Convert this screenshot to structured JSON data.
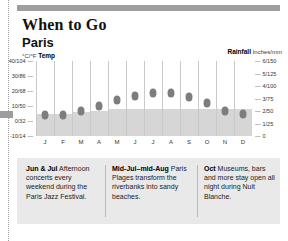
{
  "header": {
    "title": "When to Go",
    "subtitle": "Paris"
  },
  "legend": {
    "left_units": "°C/°F",
    "left_label": "Temp",
    "right_label": "Rainfall",
    "right_units": "Inches/mm"
  },
  "chart_data": {
    "type": "bar",
    "subtitle": "Paris",
    "categories": [
      "J",
      "F",
      "M",
      "A",
      "M",
      "J",
      "J",
      "A",
      "S",
      "O",
      "N",
      "D"
    ],
    "months_full": [
      "January",
      "February",
      "March",
      "April",
      "May",
      "June",
      "July",
      "August",
      "September",
      "October",
      "November",
      "December"
    ],
    "grid": false,
    "legend_position": "top",
    "series": [
      {
        "name": "Rainfall",
        "type": "bar",
        "unit": "Inches/mm",
        "values": [
          1.8,
          1.8,
          1.9,
          2.0,
          2.2,
          2.2,
          2.2,
          2.2,
          2.2,
          2.2,
          2.2,
          2.2
        ],
        "axis": "right",
        "color": "#d6d6d6"
      },
      {
        "name": "Temp",
        "type": "scatter",
        "unit": "°C/°F",
        "values": [
          4,
          4,
          7,
          10,
          14,
          17,
          19,
          19,
          16,
          12,
          7,
          5
        ],
        "axis": "left",
        "color": "#7d7d7d"
      }
    ],
    "left_axis": {
      "label": "°C/°F Temp",
      "ylim": [
        -10,
        40
      ],
      "ticks": [
        40,
        30,
        20,
        10,
        0,
        -10
      ],
      "tick_labels": [
        "40/104",
        "30/86",
        "20/68",
        "10/50",
        "0/32",
        "-10/14"
      ]
    },
    "right_axis": {
      "label": "Rainfall Inches/mm",
      "ylim": [
        0,
        6
      ],
      "ticks": [
        6,
        5,
        4,
        3,
        2,
        1,
        0
      ],
      "tick_labels": [
        "6/150",
        "5/125",
        "4/100",
        "3/75",
        "2/50",
        "1/25",
        "0"
      ]
    }
  },
  "notes": [
    {
      "id": "note-jun-jul",
      "bold": "Jun & Jul",
      "text": " Afternoon concerts every weekend during the Paris Jazz Festival."
    },
    {
      "id": "note-mid-jul-mid-aug",
      "bold": "Mid-Jul–mid-Aug",
      "text": " Paris Plages transform the riverbanks into sandy beaches."
    },
    {
      "id": "note-oct",
      "bold": "Oct",
      "text": " Museums, bars and more stay open all night during Nuit Blanche."
    }
  ],
  "colors": {
    "bar": "#d6d6d6",
    "dot": "#7d7d7d",
    "band": "#9e9e9e",
    "notes_bg": "#e9e9e9"
  }
}
